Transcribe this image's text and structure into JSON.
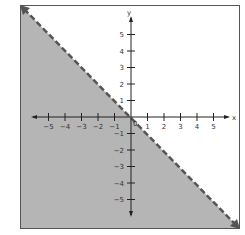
{
  "chart_data": {
    "type": "area",
    "title": "",
    "xlabel": "x",
    "ylabel": "y",
    "xlim": [
      -6,
      6
    ],
    "ylim": [
      -6,
      6
    ],
    "x_ticks": [
      -5,
      -4,
      -3,
      -2,
      -1,
      1,
      2,
      3,
      4,
      5
    ],
    "y_ticks": [
      -5,
      -4,
      -3,
      -2,
      -1,
      1,
      2,
      3,
      4,
      5
    ],
    "origin_label": "0",
    "boundary": {
      "equation": "y = -x",
      "style": "dashed",
      "points": [
        [
          -6,
          6
        ],
        [
          6,
          -6
        ]
      ]
    },
    "shaded_region": "below boundary",
    "grid": false,
    "colors": {
      "shade": "#b5b5b5",
      "line": "#555555",
      "axes": "#222222",
      "frame": "#555555"
    }
  },
  "axis_labels": {
    "x": "x",
    "y": "y"
  },
  "ticks": {
    "x": [
      "-5",
      "-4",
      "-3",
      "-2",
      "-1",
      "1",
      "2",
      "3",
      "4",
      "5"
    ],
    "y": [
      "5",
      "4",
      "3",
      "2",
      "1",
      "-1",
      "-2",
      "-3",
      "-4",
      "-5"
    ]
  },
  "origin_label": "0"
}
